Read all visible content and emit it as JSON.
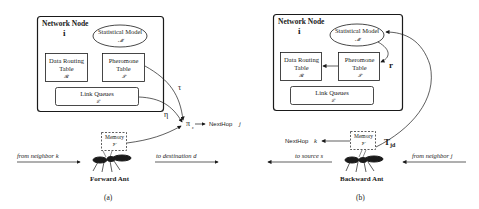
{
  "panel_a": {
    "node_title": "Network Node",
    "node_index": "i",
    "statistical_model": {
      "label": "Statistical Model",
      "symbol": "𝓜"
    },
    "data_routing_table": {
      "line1": "Data Routing",
      "line2": "Table",
      "symbol": "𝓡"
    },
    "pheromone_table": {
      "line1": "Pheromone",
      "line2": "Table",
      "symbol": "𝓣"
    },
    "link_queues": {
      "label": "Link Queues",
      "symbol": "𝓛"
    },
    "tau": "τ",
    "eta": "η",
    "pi": "π",
    "pi_sub": "ε",
    "next_hop": "NextHop",
    "next_hop_var": "j",
    "memory": {
      "label": "Memory",
      "symbol": "𝓥"
    },
    "from_label": "from neighbor k",
    "to_label": "to destination d",
    "ant_label": "Forward Ant",
    "caption": "(a)"
  },
  "panel_b": {
    "node_title": "Network Node",
    "node_index": "i",
    "statistical_model": {
      "label": "Statistical Model",
      "symbol": "𝓜"
    },
    "data_routing_table": {
      "line1": "Data Routing",
      "line2": "Table",
      "symbol": "𝓡"
    },
    "pheromone_table": {
      "line1": "Pheromone",
      "line2": "Table",
      "symbol": "𝓣"
    },
    "link_queues": {
      "label": "Link Queues",
      "symbol": "𝓛"
    },
    "r_label": "r",
    "t_label": "T",
    "t_sub": "jd",
    "next_hop": "NextHop",
    "next_hop_var": "k",
    "memory": {
      "label": "Memory",
      "symbol": "𝓥"
    },
    "to_label": "to source s",
    "from_label": "from neighbor j",
    "ant_label": "Backward Ant",
    "caption": "(b)"
  },
  "colors": {
    "stroke": "#1a1a1a",
    "background": "#ffffff"
  }
}
